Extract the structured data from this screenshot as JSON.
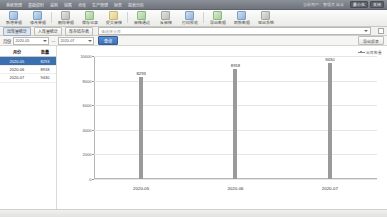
{
  "window": {
    "menu_items": [
      "系统管理",
      "基础资料",
      "采购",
      "销售",
      "仓库",
      "生产管理",
      "财务",
      "报表分析"
    ],
    "user_info": "当前用户：管理员  站点",
    "right_buttons": [
      "最小化",
      "关闭"
    ]
  },
  "toolbar": {
    "buttons": [
      {
        "label": "新增单据",
        "icon": "new-document-icon",
        "color": "blue"
      },
      {
        "label": "修改单据",
        "icon": "edit-icon",
        "color": "blue"
      },
      {
        "label": "删除单据",
        "icon": "delete-icon",
        "color": "gray"
      },
      {
        "label": "保存记录",
        "icon": "save-icon",
        "color": "green"
      },
      {
        "label": "提交审核",
        "icon": "submit-icon",
        "color": "yellow"
      },
      {
        "label": "审核通过",
        "icon": "approve-icon",
        "color": "green"
      },
      {
        "label": "反审核",
        "icon": "revoke-icon",
        "color": "gray"
      },
      {
        "label": "打印预览",
        "icon": "print-icon",
        "color": "blue"
      },
      {
        "label": "导出数据",
        "icon": "export-icon",
        "color": "green"
      },
      {
        "label": "刷新数据",
        "icon": "refresh-icon",
        "color": "blue"
      },
      {
        "label": "退出系统",
        "icon": "exit-icon",
        "color": "gray"
      }
    ]
  },
  "tabs": {
    "buttons": [
      {
        "label": "出库量统计",
        "selected": true
      },
      {
        "label": "入库量统计",
        "selected": false
      },
      {
        "label": "库存结存表",
        "selected": false
      }
    ],
    "combo_placeholder": "请选择仓库",
    "combo_value": "全部仓库"
  },
  "filter": {
    "label": "月份",
    "date_from": "2020-05",
    "date_to": "2020-07",
    "separator": "—",
    "go_label": "查询",
    "export_label": "导出报表"
  },
  "table": {
    "columns": [
      "月份",
      "数量"
    ],
    "rows": [
      {
        "month": "2020-05",
        "qty": "8293",
        "selected": true
      },
      {
        "month": "2020-06",
        "qty": "8918",
        "selected": false
      },
      {
        "month": "2020-07",
        "qty": "9430",
        "selected": false
      }
    ]
  },
  "chart_data": {
    "type": "bar",
    "title": "",
    "xlabel": "",
    "ylabel": "",
    "categories": [
      "2020-05",
      "2020-06",
      "2020-07"
    ],
    "values": [
      8293,
      8918,
      9430
    ],
    "data_labels": [
      "8293",
      "8918",
      "9430"
    ],
    "ylim": [
      0,
      10000
    ],
    "yticks": [
      0,
      2000,
      4000,
      6000,
      8000,
      10000
    ],
    "ytick_labels": [
      "0",
      "2000",
      "4000",
      "6000",
      "8000",
      "10000"
    ],
    "grid": true,
    "legend": {
      "position": "top-right",
      "entries": [
        "出库数量"
      ]
    },
    "bar_color": "#9a9a9a"
  }
}
